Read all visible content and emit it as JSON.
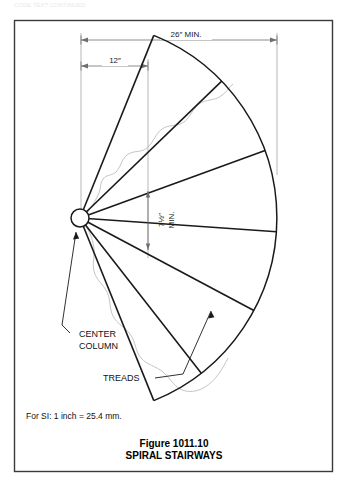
{
  "document": {
    "background_color": "#ffffff",
    "border_color": "#3a3a3a",
    "line_color": "#1a1a1a",
    "thin_line_color": "#9a9a9a",
    "outline_color": "#b8b8b8"
  },
  "dimensions": {
    "overall_width": {
      "label": "26″ MIN.",
      "x_start": 81,
      "x_end": 277,
      "y": 40
    },
    "column_offset": {
      "label": "12″",
      "x_start": 81,
      "x_end": 148,
      "y": 66
    },
    "tread_depth": {
      "label": "7½″\nMIN.",
      "label_line1": "7½″",
      "label_line2": "MIN.",
      "x": 148,
      "y_start": 191,
      "y_end": 250,
      "rotation": -90
    }
  },
  "callouts": [
    {
      "name": "center-column",
      "line1": "CENTER",
      "line2": "COLUMN",
      "text_x": 79,
      "text_y": 338
    },
    {
      "name": "treads",
      "line1": "TREADS",
      "text_x": 103,
      "text_y": 379
    }
  ],
  "geometry": {
    "center_column": {
      "cx": 80,
      "cy": 218,
      "r": 9
    },
    "sector": {
      "radius": 197,
      "start_angle_deg": -68,
      "end_angle_deg": 68
    },
    "tread_angles_deg": [
      -68,
      -44,
      -20,
      4,
      28,
      52,
      68
    ],
    "treads_count": 6
  },
  "notes": {
    "si_note": "For SI:   1 inch = 25.4 mm."
  },
  "caption": {
    "figure_number": "Figure 1011.10",
    "figure_title": "SPIRAL STAIRWAYS"
  },
  "page_header": {
    "faded_text": "CODE TEXT CONTINUED"
  }
}
